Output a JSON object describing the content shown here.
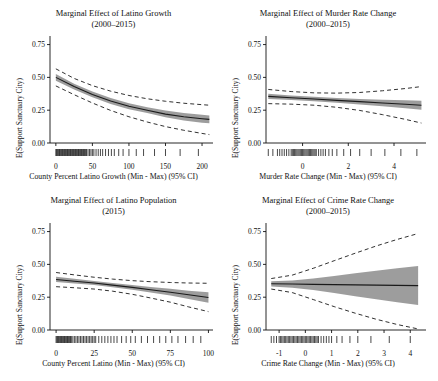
{
  "figure": {
    "ylabel": "E(Support Sanctuary City)",
    "y_ticks": [
      "0.00",
      "0.25",
      "0.50",
      "0.75"
    ],
    "y_values": [
      0.0,
      0.25,
      0.5,
      0.75
    ]
  },
  "chart_data": [
    {
      "type": "line",
      "panel": "top-left",
      "title": "Marginal Effect of Latino Growth",
      "subtitle": "(2000–2015)",
      "xlabel": "County Percent Latino Growth (Min - Max) (95% CI)",
      "ylabel": "E(Support Sanctuary City)",
      "x_ticks": [
        "0",
        "50",
        "100",
        "150",
        "200"
      ],
      "x_values": [
        0,
        50,
        100,
        150,
        200
      ],
      "xlim": [
        -8,
        215
      ],
      "ylim": [
        0.0,
        0.8
      ],
      "grid": false,
      "legend": "none",
      "series": [
        {
          "name": "estimate",
          "x": [
            0,
            25,
            50,
            75,
            100,
            125,
            150,
            175,
            200,
            210
          ],
          "values": [
            0.5,
            0.43,
            0.37,
            0.32,
            0.28,
            0.25,
            0.22,
            0.2,
            0.185,
            0.18
          ]
        },
        {
          "name": "ci_upper_inner",
          "x": [
            0,
            25,
            50,
            75,
            100,
            125,
            150,
            175,
            200,
            210
          ],
          "values": [
            0.525,
            0.452,
            0.392,
            0.342,
            0.302,
            0.272,
            0.248,
            0.228,
            0.215,
            0.21
          ]
        },
        {
          "name": "ci_lower_inner",
          "x": [
            0,
            25,
            50,
            75,
            100,
            125,
            150,
            175,
            200,
            210
          ],
          "values": [
            0.475,
            0.408,
            0.348,
            0.298,
            0.258,
            0.228,
            0.196,
            0.172,
            0.155,
            0.15
          ]
        },
        {
          "name": "ci_upper_outer",
          "x": [
            0,
            25,
            50,
            75,
            100,
            125,
            150,
            175,
            200,
            210
          ],
          "values": [
            0.565,
            0.492,
            0.437,
            0.395,
            0.362,
            0.337,
            0.318,
            0.303,
            0.292,
            0.288
          ]
        },
        {
          "name": "ci_lower_outer",
          "x": [
            0,
            25,
            50,
            75,
            100,
            125,
            150,
            175,
            200,
            210
          ],
          "values": [
            0.435,
            0.368,
            0.305,
            0.248,
            0.2,
            0.16,
            0.125,
            0.097,
            0.073,
            0.064
          ]
        }
      ],
      "rug_x": [
        0,
        1,
        2,
        3,
        4,
        5,
        6,
        7,
        8,
        9,
        10,
        11,
        12,
        13,
        14,
        15,
        16,
        17,
        18,
        19,
        20,
        21,
        22,
        23,
        24,
        25,
        26,
        27,
        28,
        29,
        30,
        31,
        32,
        33,
        34,
        35,
        36,
        37,
        38,
        39,
        40,
        41,
        42,
        44,
        46,
        48,
        50,
        52,
        55,
        58,
        61,
        64,
        68,
        72,
        76,
        80,
        86,
        92,
        100,
        110,
        120,
        135,
        150,
        170,
        195
      ]
    },
    {
      "type": "line",
      "panel": "top-right",
      "title": "Marginal Effect of Murder Rate Change",
      "subtitle": "(2000–2015)",
      "xlabel": "Murder Rate Change (Min - Max) (95% CI)",
      "ylabel": "E(Support Sanctuary City)",
      "x_ticks": [
        "0",
        "2",
        "4"
      ],
      "x_values": [
        0,
        2,
        4
      ],
      "xlim": [
        -1.6,
        5.4
      ],
      "ylim": [
        0.0,
        0.8
      ],
      "grid": false,
      "legend": "none",
      "series": [
        {
          "name": "estimate",
          "x": [
            -1.5,
            -0.5,
            0.5,
            1.5,
            2.5,
            3.5,
            4.5,
            5.2
          ],
          "values": [
            0.355,
            0.345,
            0.335,
            0.325,
            0.315,
            0.305,
            0.295,
            0.288
          ]
        },
        {
          "name": "ci_upper_inner",
          "x": [
            -1.5,
            -0.5,
            0.5,
            1.5,
            2.5,
            3.5,
            4.5,
            5.2
          ],
          "values": [
            0.375,
            0.362,
            0.352,
            0.343,
            0.336,
            0.33,
            0.325,
            0.322
          ]
        },
        {
          "name": "ci_lower_inner",
          "x": [
            -1.5,
            -0.5,
            0.5,
            1.5,
            2.5,
            3.5,
            4.5,
            5.2
          ],
          "values": [
            0.335,
            0.328,
            0.318,
            0.307,
            0.294,
            0.28,
            0.265,
            0.254
          ]
        },
        {
          "name": "ci_upper_outer",
          "x": [
            -1.5,
            -0.5,
            0.5,
            1.5,
            2.5,
            3.5,
            4.5,
            5.2
          ],
          "values": [
            0.408,
            0.392,
            0.382,
            0.38,
            0.385,
            0.398,
            0.415,
            0.43
          ]
        },
        {
          "name": "ci_lower_outer",
          "x": [
            -1.5,
            -0.5,
            0.5,
            1.5,
            2.5,
            3.5,
            4.5,
            5.2
          ],
          "values": [
            0.3,
            0.296,
            0.288,
            0.272,
            0.248,
            0.216,
            0.18,
            0.152
          ]
        }
      ],
      "rug_x": [
        -1.5,
        -1.3,
        -1.1,
        -1.0,
        -0.9,
        -0.8,
        -0.7,
        -0.6,
        -0.5,
        -0.45,
        -0.4,
        -0.35,
        -0.3,
        -0.25,
        -0.2,
        -0.15,
        -0.1,
        -0.05,
        0,
        0.05,
        0.1,
        0.15,
        0.2,
        0.25,
        0.3,
        0.35,
        0.4,
        0.45,
        0.5,
        0.55,
        0.6,
        0.7,
        0.8,
        0.9,
        1.0,
        1.15,
        1.3,
        1.5,
        1.8,
        2.1,
        2.5,
        3.0,
        3.6,
        4.3,
        5.0
      ]
    },
    {
      "type": "line",
      "panel": "bottom-left",
      "title": "Marginal Effect of Latino Population",
      "subtitle": "(2015)",
      "xlabel": "County Percent Latino (Min - Max) (95% CI)",
      "ylabel": "E(Support Sanctuary City)",
      "x_ticks": [
        "0",
        "25",
        "50",
        "75",
        "100"
      ],
      "x_values": [
        0,
        25,
        50,
        75,
        100
      ],
      "xlim": [
        -4,
        103
      ],
      "ylim": [
        0.0,
        0.8
      ],
      "grid": false,
      "legend": "none",
      "series": [
        {
          "name": "estimate",
          "x": [
            0,
            12,
            25,
            37,
            50,
            62,
            75,
            87,
            100
          ],
          "values": [
            0.385,
            0.372,
            0.358,
            0.342,
            0.325,
            0.307,
            0.288,
            0.268,
            0.248
          ]
        },
        {
          "name": "ci_upper_inner",
          "x": [
            0,
            12,
            25,
            37,
            50,
            62,
            75,
            87,
            100
          ],
          "values": [
            0.405,
            0.39,
            0.374,
            0.358,
            0.343,
            0.328,
            0.314,
            0.3,
            0.288
          ]
        },
        {
          "name": "ci_lower_inner",
          "x": [
            0,
            12,
            25,
            37,
            50,
            62,
            75,
            87,
            100
          ],
          "values": [
            0.365,
            0.354,
            0.342,
            0.326,
            0.307,
            0.286,
            0.262,
            0.236,
            0.208
          ]
        },
        {
          "name": "ci_upper_outer",
          "x": [
            0,
            12,
            25,
            37,
            50,
            62,
            75,
            87,
            100
          ],
          "values": [
            0.438,
            0.42,
            0.402,
            0.388,
            0.376,
            0.368,
            0.362,
            0.358,
            0.356
          ]
        },
        {
          "name": "ci_lower_outer",
          "x": [
            0,
            12,
            25,
            37,
            50,
            62,
            75,
            87,
            100
          ],
          "values": [
            0.33,
            0.322,
            0.312,
            0.296,
            0.272,
            0.244,
            0.212,
            0.176,
            0.14
          ]
        }
      ],
      "rug_x": [
        0,
        0.5,
        1,
        1.5,
        2,
        2.5,
        3,
        3.5,
        4,
        4.5,
        5,
        5.5,
        6,
        6.5,
        7,
        7.5,
        8,
        8.5,
        9,
        9.5,
        10,
        11,
        12,
        13,
        14,
        15,
        16,
        17,
        18,
        19,
        20,
        21,
        22,
        23,
        24,
        25,
        26,
        28,
        30,
        32,
        34,
        36,
        38,
        40,
        43,
        46,
        49,
        52,
        56,
        60,
        64,
        68,
        72,
        76,
        80,
        85,
        90,
        95
      ]
    },
    {
      "type": "line",
      "panel": "bottom-right",
      "title": "Marginal Effect of Crime Rate Change",
      "subtitle": "(2000–2015)",
      "xlabel": "Crime Rate Change (Min - Max) (95% CI)",
      "ylabel": "E(Support Sanctuary City)",
      "x_ticks": [
        "-1",
        "0",
        "1",
        "2",
        "3",
        "4"
      ],
      "x_values": [
        -1,
        0,
        1,
        2,
        3,
        4
      ],
      "xlim": [
        -1.5,
        4.6
      ],
      "ylim": [
        0.0,
        0.8
      ],
      "grid": false,
      "legend": "none",
      "series": [
        {
          "name": "estimate",
          "x": [
            -1.3,
            -0.5,
            0.3,
            1.1,
            1.9,
            2.7,
            3.5,
            4.3
          ],
          "values": [
            0.352,
            0.35,
            0.348,
            0.346,
            0.344,
            0.342,
            0.34,
            0.338
          ]
        },
        {
          "name": "ci_upper_inner",
          "x": [
            -1.3,
            -0.5,
            0.3,
            1.1,
            1.9,
            2.7,
            3.5,
            4.3
          ],
          "values": [
            0.372,
            0.378,
            0.392,
            0.412,
            0.432,
            0.452,
            0.47,
            0.488
          ]
        },
        {
          "name": "ci_lower_inner",
          "x": [
            -1.3,
            -0.5,
            0.3,
            1.1,
            1.9,
            2.7,
            3.5,
            4.3
          ],
          "values": [
            0.332,
            0.322,
            0.304,
            0.282,
            0.258,
            0.234,
            0.212,
            0.19
          ]
        },
        {
          "name": "ci_upper_outer",
          "x": [
            -1.3,
            -0.5,
            0.3,
            1.1,
            1.9,
            2.7,
            3.5,
            4.3
          ],
          "values": [
            0.392,
            0.418,
            0.47,
            0.528,
            0.585,
            0.64,
            0.69,
            0.735
          ]
        },
        {
          "name": "ci_lower_outer",
          "x": [
            -1.3,
            -0.5,
            0.3,
            1.1,
            1.9,
            2.7,
            3.5,
            4.3
          ],
          "values": [
            0.312,
            0.285,
            0.232,
            0.178,
            0.128,
            0.082,
            0.042,
            0.008
          ]
        }
      ],
      "rug_x": [
        -1.3,
        -1.2,
        -1.1,
        -1.0,
        -0.95,
        -0.9,
        -0.85,
        -0.8,
        -0.75,
        -0.7,
        -0.65,
        -0.6,
        -0.55,
        -0.5,
        -0.45,
        -0.4,
        -0.35,
        -0.3,
        -0.25,
        -0.2,
        -0.15,
        -0.1,
        -0.05,
        0,
        0.05,
        0.1,
        0.15,
        0.2,
        0.25,
        0.3,
        0.35,
        0.4,
        0.45,
        0.5,
        0.6,
        0.7,
        0.8,
        0.9,
        1.0,
        1.2,
        1.4,
        1.7,
        2.0,
        2.5,
        3.2,
        4.0
      ]
    }
  ],
  "colors": {
    "band": "#8c8c8c",
    "line": "#1a1a1a",
    "dash": "#1a1a1a",
    "text": "#111111"
  }
}
